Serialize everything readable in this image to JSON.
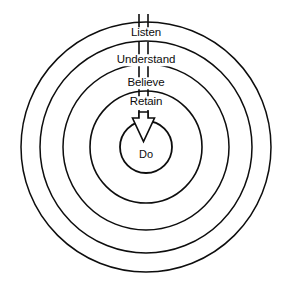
{
  "diagram": {
    "type": "concentric-circles",
    "background_color": "#ffffff",
    "stroke_color": "#0d0d0d",
    "center": {
      "x": 146,
      "y": 147
    },
    "rings": [
      {
        "key": "listen",
        "label": "Listen",
        "radius": 125,
        "stroke_width": 1.5,
        "label_y": 33
      },
      {
        "key": "understand",
        "label": "Understand",
        "radius": 106,
        "stroke_width": 1.5,
        "label_y": 60
      },
      {
        "key": "believe",
        "label": "Believe",
        "radius": 83,
        "stroke_width": 1.5,
        "label_y": 83
      },
      {
        "key": "retain",
        "label": "Retain",
        "radius": 56,
        "stroke_width": 1.6,
        "label_y": 102
      },
      {
        "key": "do",
        "label": "Do",
        "radius": 26,
        "stroke_width": 1.8,
        "label_y": 154
      }
    ],
    "arrow": {
      "name": "downward-flow-arrow",
      "direction": "down",
      "style": "hollow-outline",
      "shaft_left_x": 139,
      "shaft_right_x": 148,
      "top_y": 14,
      "tip_y": 142,
      "head_top_y": 117,
      "head_half_width": 11
    },
    "tick_marks": [
      {
        "ring": "listen",
        "y_top": 16,
        "y_bottom": 28
      },
      {
        "ring": "understand",
        "y_top": 44,
        "y_bottom": 56
      },
      {
        "ring": "believe",
        "y_top": 67,
        "y_bottom": 79
      },
      {
        "ring": "retain",
        "y_top": 89,
        "y_bottom": 101
      },
      {
        "ring": "do",
        "y_top": 109,
        "y_bottom": 118
      }
    ]
  }
}
